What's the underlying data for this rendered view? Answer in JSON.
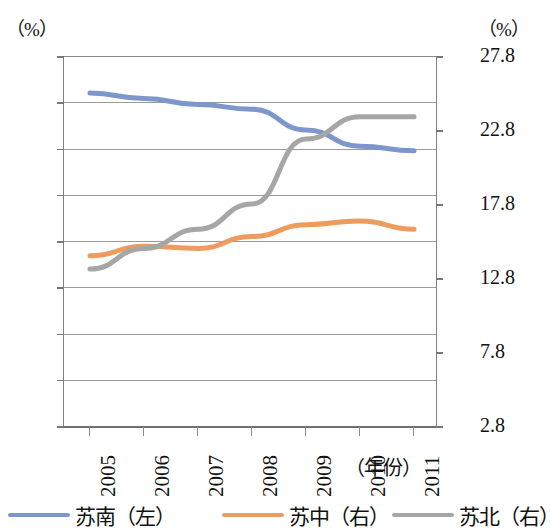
{
  "chart_data": {
    "type": "line",
    "title": "",
    "xlabel": "（年份）",
    "ylabel": "（%）",
    "y2label": "（%）",
    "grid": true,
    "legend_position": "bottom",
    "x": [
      "2005",
      "2006",
      "2007",
      "2008",
      "2009",
      "2010",
      "2011"
    ],
    "ylim": [
      0,
      80
    ],
    "yticks": [
      "0",
      "10",
      "20",
      "30",
      "40",
      "50",
      "60",
      "70",
      "80"
    ],
    "y2lim": [
      2.8,
      27.8
    ],
    "y2ticks": [
      "2.8",
      "7.8",
      "12.8",
      "17.8",
      "22.8",
      "27.8"
    ],
    "series": [
      {
        "name": "苏南（左）",
        "axis": "left",
        "color": "#7d96cc",
        "values": [
          72.0,
          70.8,
          69.5,
          68.5,
          64.0,
          60.5,
          59.5
        ]
      },
      {
        "name": "苏中（右）",
        "axis": "right",
        "color": "#ed9c5e",
        "values": [
          14.3,
          14.95,
          14.8,
          15.6,
          16.4,
          16.65,
          16.1
        ]
      },
      {
        "name": "苏北（右）",
        "axis": "right",
        "color": "#a6a6a6",
        "values": [
          13.4,
          14.8,
          16.1,
          17.8,
          22.2,
          23.7,
          23.7
        ]
      }
    ]
  },
  "axis_left": {
    "unit": "（%）",
    "ticks": [
      "80",
      "70",
      "60",
      "50",
      "40",
      "30",
      "20",
      "10",
      "0"
    ]
  },
  "axis_right": {
    "unit": "（%）",
    "ticks": [
      "27.8",
      "22.8",
      "17.8",
      "12.8",
      "7.8",
      "2.8"
    ]
  },
  "axis_x": {
    "title": "（年份）",
    "ticks": [
      "2005",
      "2006",
      "2007",
      "2008",
      "2009",
      "2010",
      "2011"
    ]
  },
  "legend": {
    "items": [
      {
        "label": "苏南（左）",
        "color": "#7d96cc"
      },
      {
        "label": "苏中（右）",
        "color": "#ed9c5e"
      },
      {
        "label": "苏北（右）",
        "color": "#a6a6a6"
      }
    ]
  }
}
